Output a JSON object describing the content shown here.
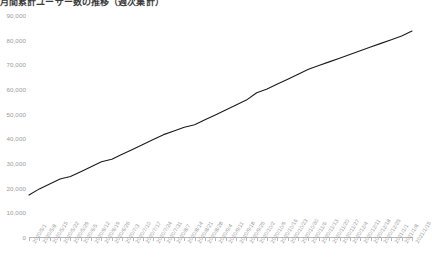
{
  "title": "月間累計ユーザー数の推移（週次集計）",
  "chart_data": {
    "type": "line",
    "title": "月間累計ユーザー数の推移（週次集計）",
    "xlabel": "",
    "ylabel": "",
    "ylim": [
      0,
      90000
    ],
    "ytick_step": 10000,
    "grid": false,
    "legend": "none",
    "line_color": "#1a1a1a",
    "axis_color": "#b9b9b9",
    "tick_label_color": "#9a9a9a",
    "ytick_labels": [
      "90,000",
      "80,000",
      "70,000",
      "60,000",
      "50,000",
      "40,000",
      "30,000",
      "20,000",
      "10,000",
      "0"
    ],
    "ytick_values": [
      90000,
      80000,
      70000,
      60000,
      50000,
      40000,
      30000,
      20000,
      10000,
      0
    ],
    "categories": [
      "2020/5/1",
      "2020/5/8",
      "2020/5/15",
      "2020/5/22",
      "2020/5/29",
      "2020/6/5",
      "2020/6/12",
      "2020/6/19",
      "2020/6/26",
      "2020/7/3",
      "2020/7/10",
      "2020/7/17",
      "2020/7/24",
      "2020/7/31",
      "2020/8/7",
      "2020/8/14",
      "2020/8/21",
      "2020/8/28",
      "2020/9/4",
      "2020/9/11",
      "2020/9/18",
      "2020/9/25",
      "2020/10/2",
      "2020/10/9",
      "2020/10/16",
      "2020/10/23",
      "2020/10/30",
      "2020/11/6",
      "2020/11/13",
      "2020/11/20",
      "2020/11/27",
      "2020/12/4",
      "2020/12/11",
      "2020/12/18",
      "2020/12/25",
      "2021/1/1",
      "2021/1/8",
      "2021/1/15"
    ],
    "values": [
      17000,
      19500,
      21500,
      23500,
      24500,
      26500,
      28500,
      30500,
      31500,
      33500,
      35500,
      37500,
      39500,
      41500,
      43000,
      44500,
      45500,
      47500,
      49500,
      51500,
      53500,
      55500,
      58500,
      60000,
      62000,
      64000,
      66000,
      68000,
      69500,
      71000,
      72500,
      74000,
      75500,
      77000,
      78500,
      80000,
      81500,
      83500
    ]
  }
}
